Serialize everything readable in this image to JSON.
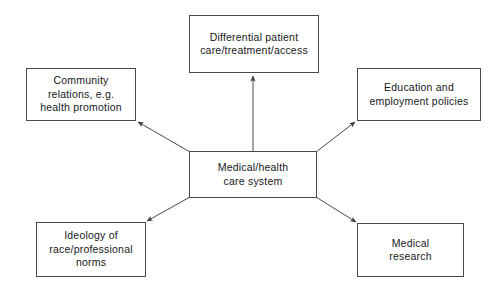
{
  "diagram": {
    "type": "hub-and-spoke flow diagram",
    "background_color": "#ffffff",
    "line_color": "#4a4a4a",
    "text_color": "#16181a",
    "center": {
      "id": "medical-health-care-system",
      "label": "Medical/health\ncare system"
    },
    "nodes": [
      {
        "id": "differential-patient-care",
        "label": "Differential patient\ncare/treatment/access",
        "position": "top"
      },
      {
        "id": "community-relations",
        "label": "Community\nrelations, e.g.\nhealth promotion",
        "position": "top-left"
      },
      {
        "id": "education-employment-policies",
        "label": "Education and\nemployment policies",
        "position": "top-right"
      },
      {
        "id": "ideology-race-professional-norms",
        "label": "Ideology of\nrace/professional\nnorms",
        "position": "bottom-left"
      },
      {
        "id": "medical-research",
        "label": "Medical\nresearch",
        "position": "bottom-right"
      }
    ],
    "arrows": [
      {
        "id": "arrow-to-differential-patient-care",
        "from": "medical-health-care-system",
        "to": "differential-patient-care",
        "direction": "up"
      },
      {
        "id": "arrow-to-community-relations",
        "from": "medical-health-care-system",
        "to": "community-relations",
        "direction": "up-left"
      },
      {
        "id": "arrow-to-education-employment-policies",
        "from": "medical-health-care-system",
        "to": "education-employment-policies",
        "direction": "up-right"
      },
      {
        "id": "arrow-to-ideology-race-professional-norms",
        "from": "medical-health-care-system",
        "to": "ideology-race-professional-norms",
        "direction": "down-left"
      },
      {
        "id": "arrow-to-medical-research",
        "from": "medical-health-care-system",
        "to": "medical-research",
        "direction": "down-right"
      }
    ]
  }
}
